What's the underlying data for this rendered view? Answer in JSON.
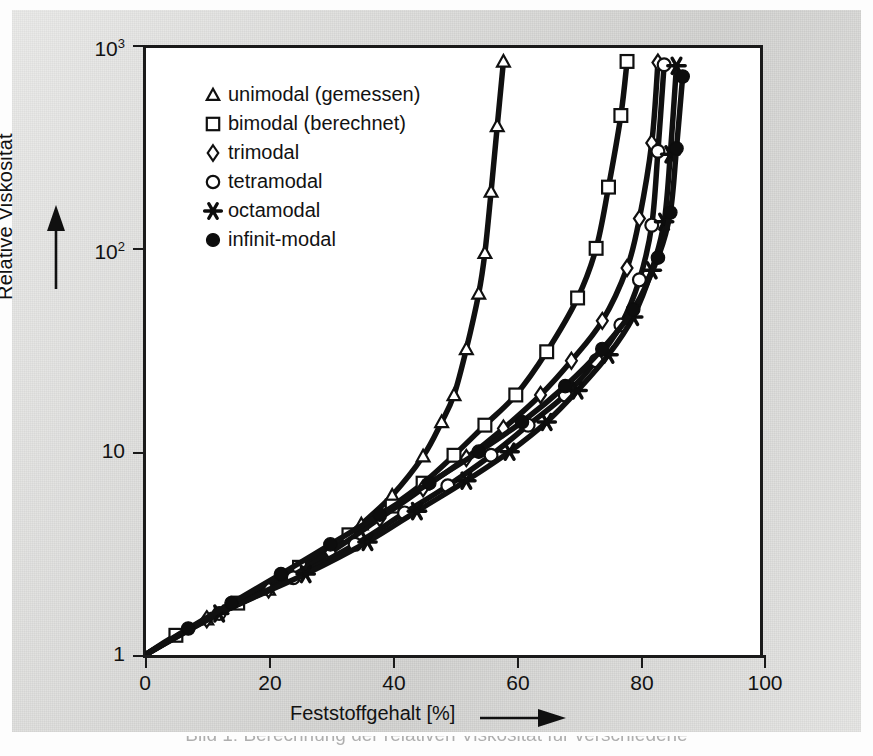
{
  "figure": {
    "background_color": "#e2e2e0",
    "plot_background": "#ffffff",
    "line_color": "#101010"
  },
  "chart_data": {
    "type": "line",
    "title": "",
    "subtitle": "",
    "xlabel": "Feststoffgehalt [%]",
    "ylabel": "Relative Viskosität",
    "xlim": [
      0,
      100
    ],
    "ylim": [
      1,
      1000
    ],
    "yscale": "log",
    "xscale": "linear",
    "grid": false,
    "legend_position": "upper-left-inside",
    "xticks": [
      0,
      20,
      40,
      60,
      80,
      100
    ],
    "xtick_labels": [
      "0",
      "20",
      "40",
      "60",
      "80",
      "100"
    ],
    "yticks": [
      1,
      10,
      100,
      1000
    ],
    "ytick_labels": [
      "1",
      "10",
      "10²",
      "10³"
    ],
    "series": [
      {
        "name": "unimodal (gemessen)",
        "marker": "triangle-open",
        "x": [
          0,
          10,
          20,
          25,
          30,
          35,
          40,
          45,
          48,
          50,
          52,
          54,
          55,
          56,
          57,
          58
        ],
        "y": [
          1.0,
          1.5,
          2.1,
          2.6,
          3.3,
          4.4,
          6.1,
          9.5,
          14,
          19,
          32,
          60,
          95,
          190,
          400,
          830
        ]
      },
      {
        "name": "bimodal (berechnet)",
        "marker": "square-open",
        "x": [
          0,
          5,
          15,
          25,
          33,
          40,
          45,
          50,
          55,
          60,
          65,
          70,
          73,
          75,
          77,
          78
        ],
        "y": [
          1.0,
          1.25,
          1.8,
          2.7,
          3.9,
          5.4,
          7.0,
          9.6,
          13.5,
          19,
          31,
          57,
          100,
          200,
          450,
          830
        ]
      },
      {
        "name": "trimodal",
        "marker": "diamond-open",
        "x": [
          0,
          10,
          20,
          30,
          38,
          45,
          52,
          58,
          64,
          69,
          74,
          78,
          80,
          82,
          83
        ],
        "y": [
          1.0,
          1.5,
          2.1,
          3.2,
          4.7,
          6.6,
          9.3,
          13,
          19,
          28,
          44,
          80,
          140,
          330,
          820
        ]
      },
      {
        "name": "tetramodal",
        "marker": "circle-open",
        "x": [
          0,
          12,
          24,
          34,
          42,
          49,
          56,
          62,
          68,
          73,
          77,
          80,
          82,
          83,
          84
        ],
        "y": [
          1.0,
          1.6,
          2.4,
          3.5,
          5.0,
          6.8,
          9.6,
          13.5,
          19,
          28,
          42,
          70,
          130,
          300,
          800
        ]
      },
      {
        "name": "octamodal",
        "marker": "star",
        "x": [
          0,
          12,
          26,
          36,
          44,
          52,
          59,
          65,
          70,
          75,
          79,
          82,
          84,
          85,
          86
        ],
        "y": [
          1.0,
          1.6,
          2.5,
          3.6,
          5.1,
          7.2,
          10,
          14,
          20,
          30,
          46,
          78,
          135,
          290,
          790
        ]
      },
      {
        "name": "infinit-modal",
        "marker": "circle-filled",
        "x": [
          0,
          7,
          14,
          22,
          30,
          38,
          46,
          54,
          61,
          68,
          74,
          79,
          83,
          85,
          86,
          87
        ],
        "y": [
          1.0,
          1.35,
          1.8,
          2.5,
          3.5,
          4.9,
          7.0,
          10,
          14,
          21,
          32,
          50,
          90,
          150,
          310,
          700
        ]
      }
    ]
  },
  "legend": {
    "items": [
      {
        "marker": "triangle-open",
        "label": "unimodal (gemessen)"
      },
      {
        "marker": "square-open",
        "label": "bimodal (berechnet)"
      },
      {
        "marker": "diamond-open",
        "label": "trimodal"
      },
      {
        "marker": "circle-open",
        "label": "tetramodal"
      },
      {
        "marker": "star",
        "label": "octamodal"
      },
      {
        "marker": "circle-filled",
        "label": "infinit-modal"
      }
    ]
  },
  "axes": {
    "y_title": "Relative Viskosität",
    "x_title": "Feststoffgehalt [%]",
    "y_tick_labels": [
      {
        "base": "10",
        "exp": "3"
      },
      {
        "base": "10",
        "exp": "2"
      },
      {
        "base": "10",
        "exp": ""
      },
      {
        "base": "1",
        "exp": ""
      }
    ],
    "x_tick_labels": [
      "0",
      "20",
      "40",
      "60",
      "80",
      "100"
    ]
  },
  "caption": {
    "text": "Bild 1: Berechnung der relativen Viskosität für verschiedene"
  }
}
